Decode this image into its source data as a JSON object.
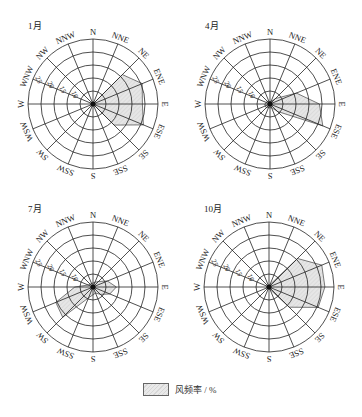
{
  "chart_data": [
    {
      "type": "radar-windrose",
      "title": "1月",
      "directions": [
        "N",
        "NNE",
        "NE",
        "ENE",
        "E",
        "ESE",
        "SE",
        "SSE",
        "S",
        "SSW",
        "SW",
        "WSW",
        "W",
        "WNW",
        "NW",
        "NNW"
      ],
      "ring_labels": [
        "5",
        "10",
        "15",
        "20",
        "25"
      ],
      "rlim": [
        0,
        25
      ],
      "values": [
        0,
        0,
        16,
        20.5,
        19,
        21,
        11.5,
        0,
        0,
        0,
        0,
        0,
        0,
        0,
        0,
        0
      ],
      "center": [
        93,
        104
      ]
    },
    {
      "type": "radar-windrose",
      "title": "4月",
      "directions": [
        "N",
        "NNE",
        "NE",
        "ENE",
        "E",
        "ESE",
        "SE",
        "SSE",
        "S",
        "SSW",
        "SW",
        "WSW",
        "W",
        "WNW",
        "NW",
        "NNW"
      ],
      "ring_labels": [
        "5",
        "10",
        "15",
        "20",
        "25"
      ],
      "rlim": [
        0,
        25
      ],
      "values": [
        1,
        1,
        3,
        11,
        19,
        22,
        4,
        1.5,
        1.5,
        1.5,
        2,
        2,
        2,
        1.5,
        1.5,
        1
      ],
      "center": [
        270,
        104
      ]
    },
    {
      "type": "radar-windrose",
      "title": "7月",
      "directions": [
        "N",
        "NNE",
        "NE",
        "ENE",
        "E",
        "ESE",
        "SE",
        "SSE",
        "S",
        "SSW",
        "SW",
        "WSW",
        "W",
        "WNW",
        "NW",
        "NNW"
      ],
      "ring_labels": [
        "5",
        "10",
        "15",
        "20",
        "25"
      ],
      "rlim": [
        0,
        25
      ],
      "values": [
        1.5,
        2,
        3,
        6,
        9,
        7,
        4,
        2.5,
        3,
        4.5,
        16.5,
        15.5,
        7,
        2,
        1.5,
        1.5
      ],
      "center": [
        93,
        287
      ]
    },
    {
      "type": "radar-windrose",
      "title": "10月",
      "directions": [
        "N",
        "NNE",
        "NE",
        "ENE",
        "E",
        "ESE",
        "SE",
        "SSE",
        "S",
        "SSW",
        "SW",
        "WSW",
        "W",
        "WNW",
        "NW",
        "NNW"
      ],
      "ring_labels": [
        "5",
        "10",
        "15",
        "20",
        "25"
      ],
      "rlim": [
        0,
        25
      ],
      "values": [
        0,
        1,
        15.5,
        22,
        21.5,
        20.5,
        11,
        1,
        0,
        0,
        0,
        0,
        0,
        0,
        0,
        0
      ],
      "center": [
        269,
        287
      ]
    }
  ],
  "legend": {
    "label": "风频率 / %"
  },
  "style": {
    "ring_step_px": 13,
    "fill_color": "#e4e4e4",
    "line_color": "#222222"
  }
}
